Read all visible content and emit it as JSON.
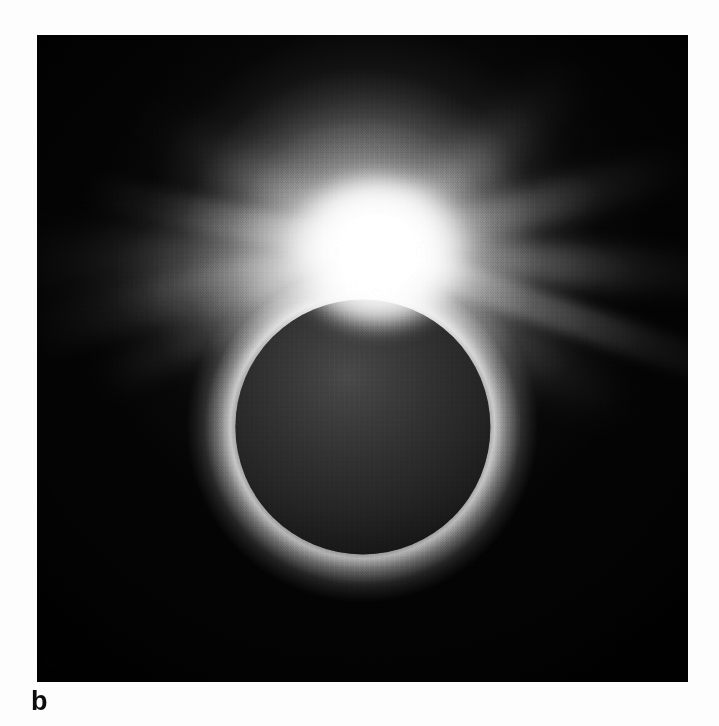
{
  "figure": {
    "panel_label": "b",
    "media": "black-and-white halftone print",
    "caption_text": ""
  },
  "page": {
    "background_color": "#fdfdfd",
    "width_px": 719,
    "height_px": 726
  },
  "photo": {
    "left_px": 37,
    "top_px": 35,
    "width_px": 651,
    "height_px": 647,
    "background_color": "#040404",
    "border_color": "#000000"
  },
  "scene": {
    "moon_disk": {
      "name": "lunar-silhouette",
      "center_x_px": 362,
      "center_y_px": 428,
      "radius_px": 127,
      "fill_color": "#2b2b2b",
      "limb_glow_color": "#ffffff"
    },
    "bright_point": {
      "name": "diamond-ring-prominence",
      "center_x_px": 378,
      "center_y_px": 252,
      "peak_color": "#ffffff",
      "description": "saturated blaze at the upper limb"
    },
    "corona": {
      "name": "solar-corona",
      "inner_glow_color": "#f2f2f2",
      "outer_glow_color": "#8a8a8a",
      "extent_px": 330,
      "streamers": [
        {
          "label": "west-upper-fan",
          "angle_deg": 182,
          "length_pct": 58,
          "width_pct": 9,
          "blur": "soft"
        },
        {
          "label": "west-mid-fan",
          "angle_deg": 193,
          "length_pct": 56,
          "width_pct": 7,
          "blur": "normal"
        },
        {
          "label": "west-lower-fan",
          "angle_deg": 205,
          "length_pct": 48,
          "width_pct": 6,
          "blur": "normal"
        },
        {
          "label": "west-upper-thin",
          "angle_deg": 168,
          "length_pct": 46,
          "width_pct": 5,
          "blur": "thin"
        },
        {
          "label": "north-west-ray",
          "angle_deg": 150,
          "length_pct": 40,
          "width_pct": 6,
          "blur": "soft"
        },
        {
          "label": "north-east-ray",
          "angle_deg": 42,
          "length_pct": 42,
          "width_pct": 7,
          "blur": "soft"
        },
        {
          "label": "east-upper-ray",
          "angle_deg": 16,
          "length_pct": 50,
          "width_pct": 6,
          "blur": "normal"
        },
        {
          "label": "east-main-ray",
          "angle_deg": -4,
          "length_pct": 56,
          "width_pct": 6,
          "blur": "normal"
        },
        {
          "label": "east-long-ray",
          "angle_deg": -19,
          "length_pct": 62,
          "width_pct": 5,
          "blur": "thin"
        },
        {
          "label": "east-lower-ray",
          "angle_deg": -33,
          "length_pct": 46,
          "width_pct": 6,
          "blur": "soft"
        },
        {
          "label": "south-east-ray",
          "angle_deg": -52,
          "length_pct": 34,
          "width_pct": 7,
          "blur": "soft"
        },
        {
          "label": "south-west-ray",
          "angle_deg": 228,
          "length_pct": 32,
          "width_pct": 7,
          "blur": "soft"
        }
      ]
    },
    "plume": {
      "name": "polar-plume",
      "direction": "upward",
      "color": "#e8e8e8"
    }
  },
  "colors": {
    "sky_black": "#040404",
    "disk_gray": "#2b2b2b",
    "corona_white": "#ffffff",
    "label_black": "#0d0d0d",
    "page_white": "#fdfdfd"
  }
}
